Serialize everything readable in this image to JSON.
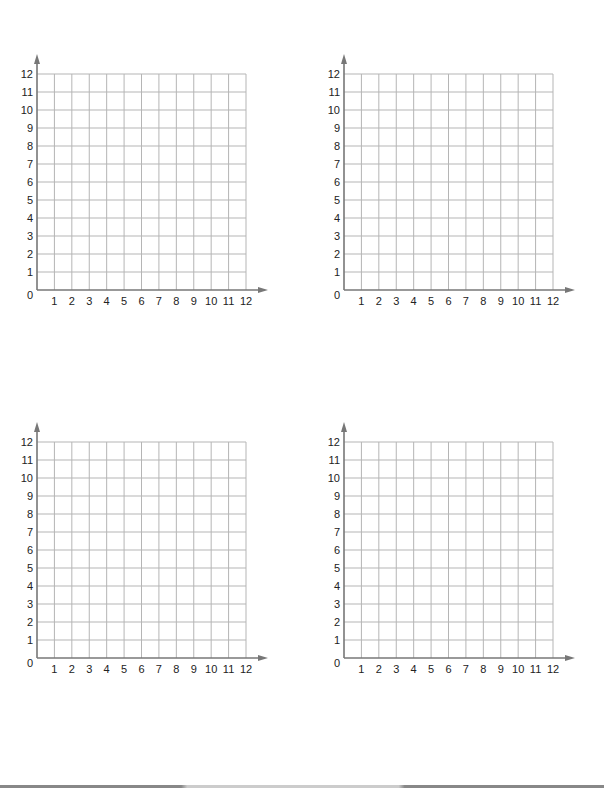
{
  "chart_data": [
    {
      "type": "scatter",
      "title": "",
      "xlabel": "",
      "ylabel": "",
      "xlim": [
        0,
        12
      ],
      "ylim": [
        0,
        12
      ],
      "grid": true,
      "x_ticks": [
        "1",
        "2",
        "3",
        "4",
        "5",
        "6",
        "7",
        "8",
        "9",
        "10",
        "11",
        "12"
      ],
      "y_ticks": [
        "1",
        "2",
        "3",
        "4",
        "5",
        "6",
        "7",
        "8",
        "9",
        "10",
        "11",
        "12"
      ],
      "origin_label": "0",
      "points": []
    },
    {
      "type": "scatter",
      "title": "",
      "xlabel": "",
      "ylabel": "",
      "xlim": [
        0,
        12
      ],
      "ylim": [
        0,
        12
      ],
      "grid": true,
      "x_ticks": [
        "1",
        "2",
        "3",
        "4",
        "5",
        "6",
        "7",
        "8",
        "9",
        "10",
        "11",
        "12"
      ],
      "y_ticks": [
        "1",
        "2",
        "3",
        "4",
        "5",
        "6",
        "7",
        "8",
        "9",
        "10",
        "11",
        "12"
      ],
      "origin_label": "0",
      "points": []
    },
    {
      "type": "scatter",
      "title": "",
      "xlabel": "",
      "ylabel": "",
      "xlim": [
        0,
        12
      ],
      "ylim": [
        0,
        12
      ],
      "grid": true,
      "x_ticks": [
        "1",
        "2",
        "3",
        "4",
        "5",
        "6",
        "7",
        "8",
        "9",
        "10",
        "11",
        "12"
      ],
      "y_ticks": [
        "1",
        "2",
        "3",
        "4",
        "5",
        "6",
        "7",
        "8",
        "9",
        "10",
        "11",
        "12"
      ],
      "origin_label": "0",
      "points": []
    },
    {
      "type": "scatter",
      "title": "",
      "xlabel": "",
      "ylabel": "",
      "xlim": [
        0,
        12
      ],
      "ylim": [
        0,
        12
      ],
      "grid": true,
      "x_ticks": [
        "1",
        "2",
        "3",
        "4",
        "5",
        "6",
        "7",
        "8",
        "9",
        "10",
        "11",
        "12"
      ],
      "y_ticks": [
        "1",
        "2",
        "3",
        "4",
        "5",
        "6",
        "7",
        "8",
        "9",
        "10",
        "11",
        "12"
      ],
      "origin_label": "0",
      "points": []
    }
  ],
  "colors": {
    "grid": "#b5b5b5",
    "axis": "#777777",
    "text": "#222222"
  }
}
